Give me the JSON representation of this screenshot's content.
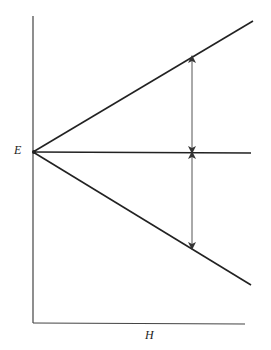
{
  "diagram": {
    "type": "zeeman-splitting-energy-diagram",
    "y_axis_label": "E",
    "x_axis_label": "H",
    "colors": {
      "line": "#222222",
      "arrow": "#333333",
      "background": "#ffffff"
    },
    "lines": [
      {
        "name": "upper-level",
        "from": [
          33,
          152
        ],
        "to": [
          253,
          21
        ]
      },
      {
        "name": "middle-level",
        "from": [
          33,
          152
        ],
        "to": [
          251,
          153
        ]
      },
      {
        "name": "lower-level",
        "from": [
          33,
          152
        ],
        "to": [
          251,
          285
        ]
      }
    ],
    "arrows": [
      {
        "name": "upper-splitting",
        "x": 192,
        "y1": 57,
        "y2": 152
      },
      {
        "name": "lower-splitting",
        "x": 192,
        "y1": 153,
        "y2": 248
      }
    ]
  }
}
